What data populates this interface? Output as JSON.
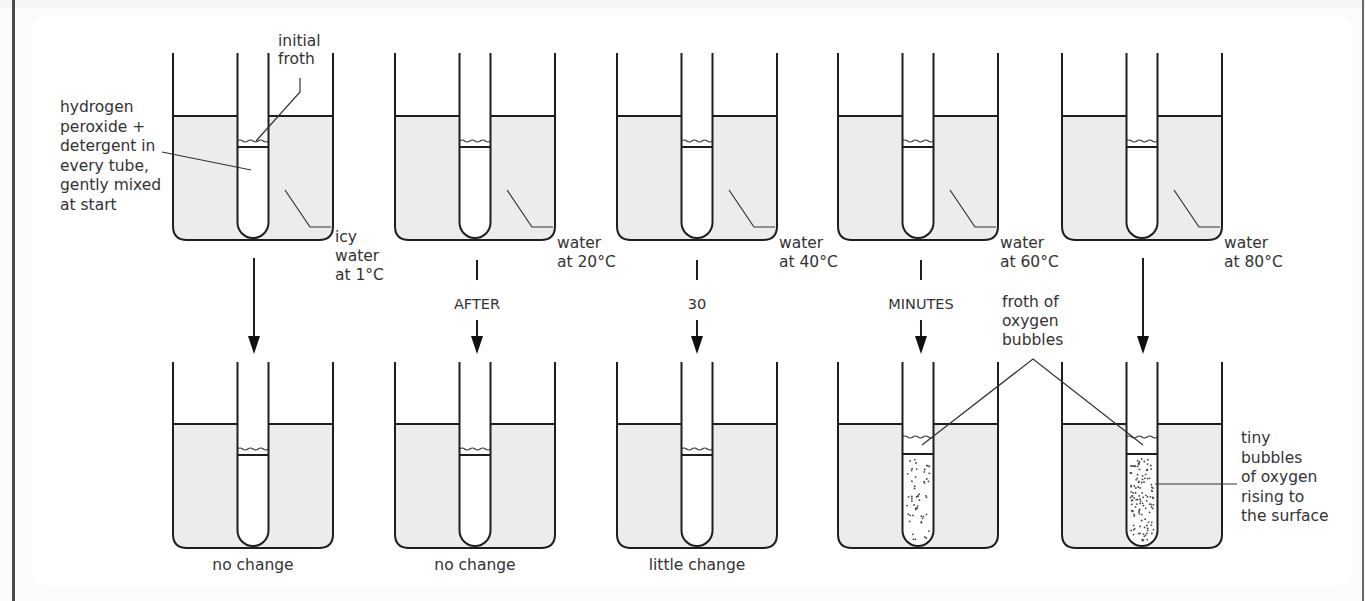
{
  "figure": {
    "shared_labels": {
      "tube_contents": [
        "hydrogen",
        "peroxide +",
        "detergent in",
        "every tube,",
        "gently mixed",
        "at start"
      ],
      "initial_froth": [
        "initial",
        "froth"
      ],
      "froth_bubbles": [
        "froth of",
        "oxygen",
        "bubbles"
      ],
      "tiny_bubbles": [
        "tiny",
        "bubbles",
        "of oxygen",
        "rising to",
        "the surface"
      ]
    },
    "time_words": [
      "AFTER",
      "30",
      "MINUTES"
    ],
    "colors": {
      "water_fill": "#ececec",
      "ink": "#1e1e1e",
      "text": "#333333"
    },
    "setups": [
      {
        "id": "1c",
        "water_label": [
          "icy",
          "water",
          "at 1°C"
        ],
        "result": "no change",
        "froth_level": "low",
        "bubbles": "none"
      },
      {
        "id": "20c",
        "water_label": [
          "water",
          "at 20°C"
        ],
        "result": "no change",
        "froth_level": "low",
        "bubbles": "none"
      },
      {
        "id": "40c",
        "water_label": [
          "water",
          "at 40°C"
        ],
        "result": "little change",
        "froth_level": "low",
        "bubbles": "none"
      },
      {
        "id": "60c",
        "water_label": [
          "water",
          "at 60°C"
        ],
        "result": "",
        "froth_level": "high",
        "bubbles": "few"
      },
      {
        "id": "80c",
        "water_label": [
          "water",
          "at 80°C"
        ],
        "result": "",
        "froth_level": "high",
        "bubbles": "many"
      }
    ]
  }
}
